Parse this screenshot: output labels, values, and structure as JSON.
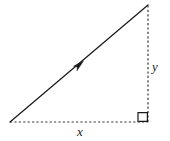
{
  "figure": {
    "background_color": "#ffffff",
    "width": 170,
    "height": 141,
    "labels": {
      "horizontal_leg": "x",
      "vertical_leg": "y"
    },
    "colors": {
      "stroke": "#1a1a1a",
      "dashed_stroke": "#3a3a3a",
      "label_text": "#1a1a1a"
    },
    "geometry": {
      "vertex_origin": [
        10,
        122
      ],
      "vertex_corner": [
        148,
        122
      ],
      "vertex_top": [
        148,
        5
      ],
      "arrow_position": [
        79,
        65
      ],
      "right_angle_marker": {
        "x": 138,
        "y": 112,
        "size": 10
      }
    },
    "elements": {
      "hypotenuse_style": "solid",
      "horizontal_leg_style": "dashed",
      "vertical_leg_style": "dashed",
      "arrow_direction": "up-right",
      "right_angle_label": "90 degrees"
    }
  }
}
